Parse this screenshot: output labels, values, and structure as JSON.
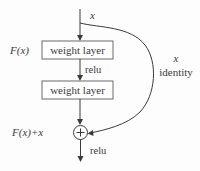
{
  "diagram": {
    "input_label": "x",
    "function_label": "F(x)",
    "sum_label": "F(x)+x",
    "layers": [
      {
        "label": "weight layer"
      },
      {
        "label": "weight layer"
      }
    ],
    "inner_activation": "relu",
    "output_activation": "relu",
    "shortcut": {
      "symbol": "x",
      "label": "identity"
    },
    "add_symbol": "+",
    "colors": {
      "stroke": "#3a3a3a",
      "box_border": "#6b6b6b",
      "background": "#fdfdfd"
    }
  }
}
